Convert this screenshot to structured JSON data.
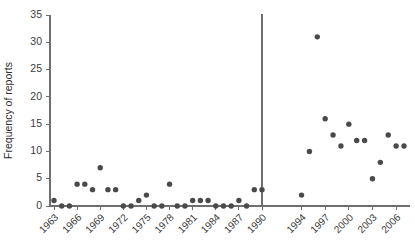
{
  "chart_data": {
    "type": "scatter",
    "title": "",
    "xlabel": "",
    "ylabel": "Frequency of reports",
    "ylim": [
      0,
      35
    ],
    "yticks": [
      0,
      5,
      10,
      15,
      20,
      25,
      30,
      35
    ],
    "xticks": [
      "1963",
      "1966",
      "1969",
      "1972",
      "1975",
      "1978",
      "1981",
      "1984",
      "1987",
      "1990",
      "1994",
      "1997",
      "2000",
      "2003",
      "2006"
    ],
    "grid": false,
    "legend": null,
    "axis_break_after": "1990",
    "annotations": [
      {
        "name": "vertical-divider",
        "x": "1990",
        "note": "vertical reference line at 1990"
      }
    ],
    "point_color": "#4a4a4a",
    "axis_color": "#6e6e6e",
    "x": [
      1963,
      1964,
      1965,
      1966,
      1967,
      1968,
      1969,
      1970,
      1971,
      1972,
      1973,
      1974,
      1975,
      1976,
      1977,
      1978,
      1979,
      1980,
      1981,
      1982,
      1983,
      1984,
      1985,
      1986,
      1987,
      1988,
      1989,
      1990,
      1994,
      1995,
      1996,
      1997,
      1998,
      1999,
      2000,
      2001,
      2002,
      2003,
      2004,
      2005,
      2006,
      2007
    ],
    "values": [
      1,
      0,
      0,
      4,
      4,
      3,
      7,
      3,
      3,
      0,
      0,
      1,
      2,
      0,
      0,
      4,
      0,
      0,
      1,
      1,
      1,
      0,
      0,
      0,
      1,
      0,
      3,
      3,
      2,
      10,
      31,
      16,
      13,
      11,
      15,
      12,
      12,
      5,
      8,
      13,
      11,
      11
    ]
  }
}
